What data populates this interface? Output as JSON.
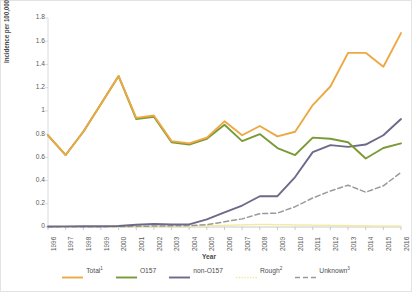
{
  "chart_data": {
    "type": "line",
    "title": "",
    "xlabel": "Year",
    "ylabel": "Incidence per 100,000 population",
    "grid": false,
    "legend_position": "bottom",
    "ylim": [
      0,
      1.8
    ],
    "ytick_labels": [
      "1.8",
      "1.6",
      "1.4",
      "1.2",
      "1",
      "0.8",
      "0.6",
      "0.4",
      "0.2",
      "0"
    ],
    "ytick_values": [
      1.8,
      1.6,
      1.4,
      1.2,
      1.0,
      0.8,
      0.6,
      0.4,
      0.2,
      0
    ],
    "categories": [
      "1996",
      "1997",
      "1998",
      "1999",
      "2000",
      "2001",
      "2002",
      "2003",
      "2004",
      "2005",
      "2006",
      "2007",
      "2008",
      "2009",
      "2010",
      "2011",
      "2012",
      "2013",
      "2014",
      "2015",
      "2016"
    ],
    "series": [
      {
        "name": "Total",
        "superscript": "1",
        "color": "#eda843",
        "style": "solid",
        "values": [
          0.79,
          0.62,
          0.82,
          1.06,
          1.3,
          0.94,
          0.96,
          0.74,
          0.72,
          0.77,
          0.91,
          0.79,
          0.87,
          0.78,
          0.82,
          1.05,
          1.21,
          1.5,
          1.5,
          1.38,
          1.67
        ]
      },
      {
        "name": "O157",
        "superscript": "",
        "color": "#7a9a35",
        "style": "solid",
        "values": [
          0.79,
          0.62,
          0.82,
          1.06,
          1.3,
          0.93,
          0.95,
          0.73,
          0.71,
          0.76,
          0.88,
          0.74,
          0.8,
          0.68,
          0.62,
          0.77,
          0.76,
          0.73,
          0.59,
          0.68,
          0.72
        ]
      },
      {
        "name": "non-O157",
        "superscript": "",
        "color": "#6b6a8a",
        "style": "solid",
        "values": [
          0.004,
          0.005,
          0.006,
          0.006,
          0.008,
          0.02,
          0.026,
          0.022,
          0.023,
          0.065,
          0.125,
          0.185,
          0.265,
          0.265,
          0.43,
          0.645,
          0.705,
          0.69,
          0.71,
          0.79,
          0.93
        ]
      },
      {
        "name": "Rough",
        "superscript": "2",
        "color": "#f2ea9a",
        "style": "dotted",
        "values": [
          0.0,
          0.0,
          0.0,
          0.0,
          0.001,
          0.002,
          0.003,
          0.004,
          0.006,
          0.01,
          0.014,
          0.018,
          0.022,
          0.02,
          0.018,
          0.016,
          0.014,
          0.012,
          0.01,
          0.009,
          0.008
        ]
      },
      {
        "name": "Unknown",
        "superscript": "3",
        "color": "#9a9a9a",
        "style": "dashed",
        "values": [
          0.002,
          0.002,
          0.003,
          0.003,
          0.004,
          0.006,
          0.008,
          0.01,
          0.012,
          0.02,
          0.045,
          0.07,
          0.115,
          0.12,
          0.175,
          0.25,
          0.31,
          0.36,
          0.3,
          0.355,
          0.47
        ]
      }
    ]
  },
  "axis": {
    "x_title": "Year",
    "y_title": "Incidence per 100,000 population"
  }
}
